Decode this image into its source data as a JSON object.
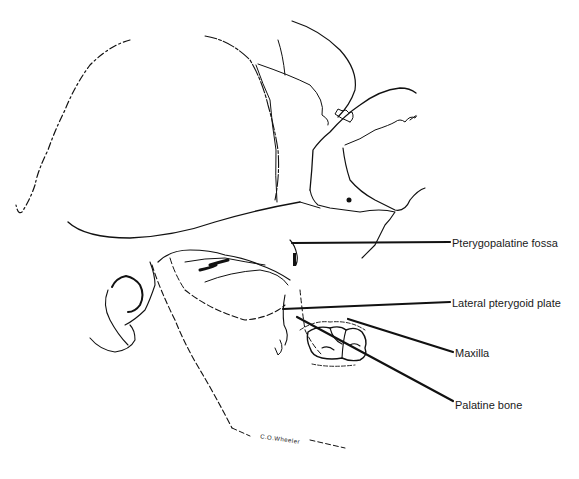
{
  "diagram": {
    "line_color": "#111111",
    "background": "#ffffff",
    "labels": [
      {
        "id": "pterygopalatine-fossa",
        "text": "Pterygopalatine fossa",
        "x": 452,
        "y": 237
      },
      {
        "id": "lateral-pterygoid-plate",
        "text": "Lateral pterygoid plate",
        "x": 452,
        "y": 297
      },
      {
        "id": "maxilla",
        "text": "Maxilla",
        "x": 455,
        "y": 347
      },
      {
        "id": "palatine-bone",
        "text": "Palatine bone",
        "x": 455,
        "y": 399
      }
    ],
    "signature": "C.O.Wheeler"
  }
}
